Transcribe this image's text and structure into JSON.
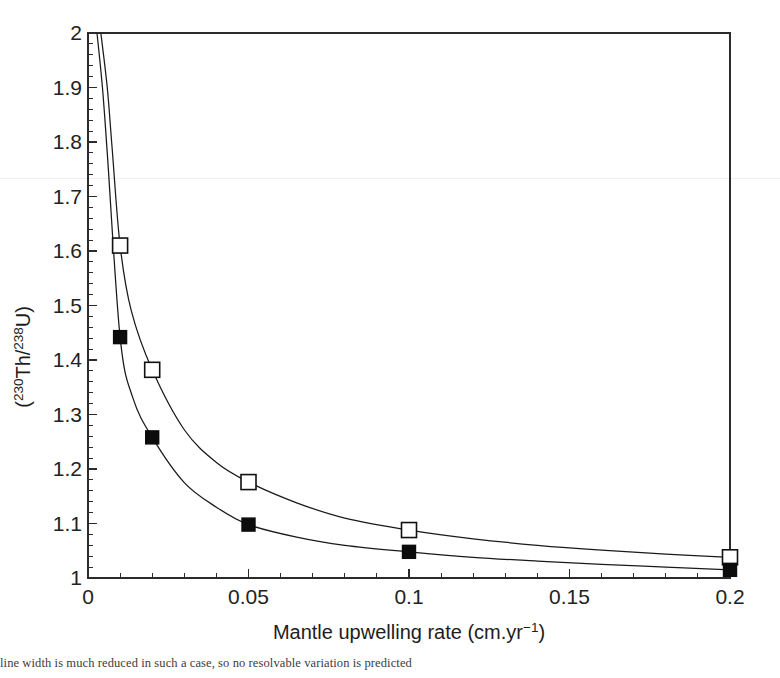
{
  "figure": {
    "background_color": "#ffffff",
    "foreground_color": "#1a1a1a",
    "caption_fragment": "line width is much reduced in such a case, so no resolvable variation is predicted"
  },
  "axes": {
    "x": {
      "label_main": "Mantle upwelling rate (cm.yr",
      "label_sup": "−1",
      "label_tail": ")",
      "label_full": "Mantle upwelling rate (cm.yr−1)",
      "ticks": [
        "0",
        "0.05",
        "0.1",
        "0.15",
        "0.2"
      ],
      "tick_values": [
        0,
        0.05,
        0.1,
        0.15,
        0.2
      ],
      "minor_tick_step": 0.01,
      "range": [
        0,
        0.2
      ]
    },
    "y": {
      "label_open_paren": "(",
      "label_sup1": "230",
      "label_el1": "Th/",
      "label_sup2": "238",
      "label_el2": "U",
      "label_close_paren": ")",
      "label_full": "(230Th/238U)",
      "ticks": [
        "1",
        "1.1",
        "1.2",
        "1.3",
        "1.4",
        "1.5",
        "1.6",
        "1.7",
        "1.8",
        "1.9",
        "2"
      ],
      "tick_values": [
        1,
        1.1,
        1.2,
        1.3,
        1.4,
        1.5,
        1.6,
        1.7,
        1.8,
        1.9,
        2
      ],
      "minor_tick_step": 0.02,
      "range": [
        1,
        2
      ]
    }
  },
  "chart_data": {
    "type": "line",
    "title": "",
    "xlabel": "Mantle upwelling rate (cm.yr−1)",
    "ylabel": "(230Th/238U)",
    "xlim": [
      0,
      0.2
    ],
    "ylim": [
      1,
      2
    ],
    "grid": false,
    "legend": "none",
    "series": [
      {
        "name": "open-square-series",
        "marker": "open-square",
        "marker_fill": "#ffffff",
        "marker_stroke": "#111111",
        "points": [
          {
            "x": 0.004,
            "y": 2.0
          },
          {
            "x": 0.006,
            "y": 1.9
          },
          {
            "x": 0.0075,
            "y": 1.79
          },
          {
            "x": 0.01,
            "y": 1.61
          },
          {
            "x": 0.0135,
            "y": 1.49
          },
          {
            "x": 0.02,
            "y": 1.382
          },
          {
            "x": 0.03,
            "y": 1.272
          },
          {
            "x": 0.04,
            "y": 1.212
          },
          {
            "x": 0.05,
            "y": 1.176
          },
          {
            "x": 0.065,
            "y": 1.138
          },
          {
            "x": 0.08,
            "y": 1.11
          },
          {
            "x": 0.1,
            "y": 1.088
          },
          {
            "x": 0.12,
            "y": 1.072
          },
          {
            "x": 0.14,
            "y": 1.06
          },
          {
            "x": 0.16,
            "y": 1.051
          },
          {
            "x": 0.18,
            "y": 1.044
          },
          {
            "x": 0.2,
            "y": 1.038
          }
        ],
        "marker_points": [
          {
            "x": 0.01,
            "y": 1.61
          },
          {
            "x": 0.02,
            "y": 1.382
          },
          {
            "x": 0.05,
            "y": 1.176
          },
          {
            "x": 0.1,
            "y": 1.088
          },
          {
            "x": 0.2,
            "y": 1.038
          }
        ]
      },
      {
        "name": "filled-square-series",
        "marker": "filled-square",
        "marker_fill": "#0c0c0c",
        "marker_stroke": "#0c0c0c",
        "points": [
          {
            "x": 0.0028,
            "y": 2.0
          },
          {
            "x": 0.0045,
            "y": 1.9
          },
          {
            "x": 0.006,
            "y": 1.78
          },
          {
            "x": 0.01,
            "y": 1.442
          },
          {
            "x": 0.014,
            "y": 1.33
          },
          {
            "x": 0.02,
            "y": 1.258
          },
          {
            "x": 0.03,
            "y": 1.175
          },
          {
            "x": 0.04,
            "y": 1.13
          },
          {
            "x": 0.05,
            "y": 1.098
          },
          {
            "x": 0.065,
            "y": 1.075
          },
          {
            "x": 0.08,
            "y": 1.06
          },
          {
            "x": 0.1,
            "y": 1.048
          },
          {
            "x": 0.12,
            "y": 1.038
          },
          {
            "x": 0.14,
            "y": 1.031
          },
          {
            "x": 0.16,
            "y": 1.025
          },
          {
            "x": 0.18,
            "y": 1.02
          },
          {
            "x": 0.2,
            "y": 1.015
          }
        ],
        "marker_points": [
          {
            "x": 0.01,
            "y": 1.442
          },
          {
            "x": 0.02,
            "y": 1.258
          },
          {
            "x": 0.05,
            "y": 1.098
          },
          {
            "x": 0.1,
            "y": 1.048
          },
          {
            "x": 0.2,
            "y": 1.015
          }
        ]
      }
    ]
  }
}
